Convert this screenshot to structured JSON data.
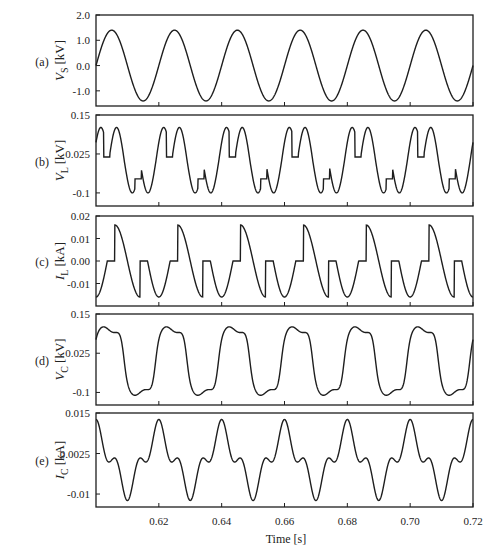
{
  "chart_data": [
    {
      "type": "line",
      "panel": "(a)",
      "ylabel_main": "V",
      "ylabel_sub": "S",
      "ylabel_unit": "[kV]",
      "yticks": [
        2.0,
        1.0,
        0.0,
        -1.0
      ],
      "ytick_labels": [
        "2.0",
        "1.0",
        "0.0",
        "-1.0"
      ],
      "ylim": [
        -1.6,
        2.0
      ],
      "waveform": "sine",
      "amplitude": 1.4,
      "frequency_hz": 50,
      "x_range": [
        0.6,
        0.72
      ]
    },
    {
      "type": "line",
      "panel": "(b)",
      "ylabel_main": "V",
      "ylabel_sub": "L",
      "ylabel_unit": "[kV]",
      "yticks": [
        0.15,
        0.025,
        -0.1
      ],
      "ytick_labels": [
        "0.15",
        "0.025",
        "-0.1"
      ],
      "ylim": [
        -0.142,
        0.15
      ],
      "waveform": "inductor_voltage",
      "peak": 0.11,
      "trough": -0.1,
      "flat_level": 0.015,
      "frequency_hz": 50,
      "x_range": [
        0.6,
        0.72
      ]
    },
    {
      "type": "line",
      "panel": "(c)",
      "ylabel_main": "I",
      "ylabel_sub": "L",
      "ylabel_unit": "[kA]",
      "yticks": [
        0.02,
        0.01,
        0.0,
        -0.01
      ],
      "ytick_labels": [
        "0.02",
        "0.01",
        "0.00",
        "-0.01"
      ],
      "ylim": [
        -0.02,
        0.02
      ],
      "waveform": "inductor_current",
      "peak": 0.016,
      "flat_level": 0.0,
      "frequency_hz": 50,
      "x_range": [
        0.6,
        0.72
      ]
    },
    {
      "type": "line",
      "panel": "(d)",
      "ylabel_main": "V",
      "ylabel_sub": "C",
      "ylabel_unit": "[kV]",
      "yticks": [
        0.15,
        0.025,
        -0.1
      ],
      "ytick_labels": [
        "0.15",
        "0.025",
        "-0.1"
      ],
      "ylim": [
        -0.14,
        0.15
      ],
      "waveform": "capacitor_voltage",
      "peak": 0.11,
      "frequency_hz": 50,
      "x_range": [
        0.6,
        0.72
      ]
    },
    {
      "type": "line",
      "panel": "(e)",
      "ylabel_main": "I",
      "ylabel_sub": "C",
      "ylabel_unit": "[kA]",
      "yticks": [
        0.015,
        0.0025,
        -0.01
      ],
      "ytick_labels": [
        "0.015",
        "0.0025",
        "-0.01"
      ],
      "ylim": [
        -0.014,
        0.015
      ],
      "waveform": "capacitor_current",
      "peak": 0.0125,
      "trough": -0.0105,
      "frequency_hz": 50,
      "x_range": [
        0.6,
        0.72
      ]
    }
  ],
  "x_axis": {
    "label": "Time [s]",
    "ticks": [
      0.62,
      0.64,
      0.66,
      0.68,
      0.7,
      0.72
    ],
    "tick_labels": [
      "0.62",
      "0.64",
      "0.66",
      "0.68",
      "0.70",
      "0.72"
    ],
    "range": [
      0.6,
      0.72
    ]
  },
  "style": {
    "line_color": "#1e1e1e",
    "axis_color": "#1e1e1e",
    "background": "#ffffff"
  }
}
